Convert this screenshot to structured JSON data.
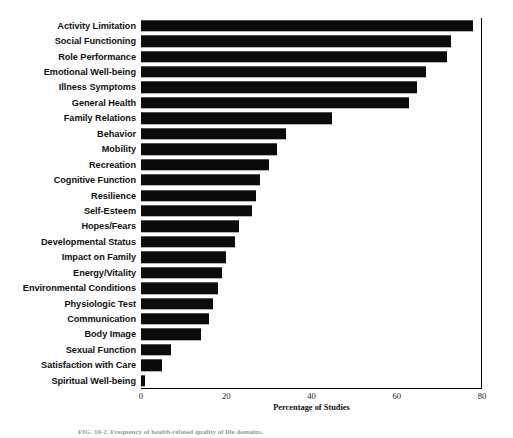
{
  "figure": {
    "caption": "FIG. 10-2. Frequency of health-related quality of life domains."
  },
  "chart_data": {
    "type": "bar",
    "orientation": "horizontal",
    "title": "",
    "xlabel": "Percentage of Studies",
    "ylabel": "",
    "xlim": [
      0,
      80
    ],
    "xticks": [
      "0",
      "20",
      "40",
      "60",
      "80"
    ],
    "grid": false,
    "legend": null,
    "bar_color": "#0b0b0b",
    "categories": [
      "Activity Limitation",
      "Social Functioning",
      "Role Performance",
      "Emotional Well-being",
      "Illness Symptoms",
      "General Health",
      "Family Relations",
      "Behavior",
      "Mobility",
      "Recreation",
      "Cognitive Function",
      "Resilience",
      "Self-Esteem",
      "Hopes/Fears",
      "Developmental Status",
      "Impact on Family",
      "Energy/Vitality",
      "Environmental Conditions",
      "Physiologic Test",
      "Communication",
      "Body Image",
      "Sexual Function",
      "Satisfaction with Care",
      "Spiritual Well-being"
    ],
    "values": [
      78,
      73,
      72,
      67,
      65,
      63,
      45,
      34,
      32,
      30,
      28,
      27,
      26,
      23,
      22,
      20,
      19,
      18,
      17,
      16,
      14,
      7,
      5,
      1
    ]
  }
}
